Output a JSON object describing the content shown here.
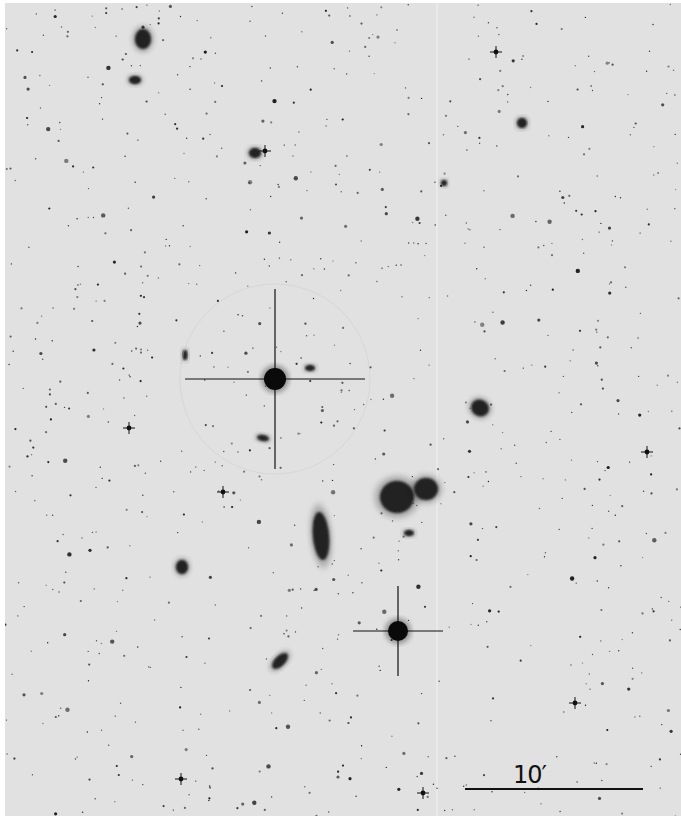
{
  "image": {
    "type": "astronomical photographic plate (negative)",
    "background_color": "#e1e1e1",
    "object_color": "#111111"
  },
  "scale_bar": {
    "label": "10′",
    "length_px": 178
  },
  "objects": {
    "bright_stars": [
      {
        "name": "bright-star-center",
        "x": 270,
        "y": 376,
        "r": 11,
        "spike": 90,
        "halo": 95
      },
      {
        "name": "bright-star-lower",
        "x": 393,
        "y": 628,
        "r": 10,
        "spike": 45,
        "halo": 0
      }
    ],
    "galaxies": [
      {
        "name": "galaxy-pair-a",
        "x": 392,
        "y": 494,
        "rx": 17,
        "ry": 16,
        "rot": 0
      },
      {
        "name": "galaxy-pair-b",
        "x": 421,
        "y": 486,
        "rx": 12,
        "ry": 11,
        "rot": 0
      },
      {
        "name": "spiral-galaxy",
        "x": 316,
        "y": 533,
        "rx": 8,
        "ry": 24,
        "rot": -5
      },
      {
        "name": "elliptical-galaxy-right",
        "x": 475,
        "y": 405,
        "rx": 9,
        "ry": 8,
        "rot": 30
      },
      {
        "name": "galaxy-top-left",
        "x": 138,
        "y": 36,
        "rx": 8,
        "ry": 10,
        "rot": 0
      },
      {
        "name": "galaxy-top-left-2",
        "x": 130,
        "y": 77,
        "rx": 6,
        "ry": 4,
        "rot": 0
      },
      {
        "name": "galaxy-lower-left",
        "x": 275,
        "y": 658,
        "rx": 5,
        "ry": 10,
        "rot": 45
      },
      {
        "name": "galaxy-left",
        "x": 177,
        "y": 564,
        "rx": 6,
        "ry": 7,
        "rot": 0
      },
      {
        "name": "galaxy-upper",
        "x": 250,
        "y": 150,
        "rx": 6,
        "ry": 5,
        "rot": 0
      },
      {
        "name": "galaxy-upper-right",
        "x": 517,
        "y": 120,
        "rx": 5,
        "ry": 5,
        "rot": 0
      },
      {
        "name": "galaxy-small-1",
        "x": 258,
        "y": 435,
        "rx": 6,
        "ry": 3,
        "rot": 10
      },
      {
        "name": "galaxy-small-2",
        "x": 305,
        "y": 365,
        "rx": 5,
        "ry": 3,
        "rot": 0
      },
      {
        "name": "galaxy-small-3",
        "x": 180,
        "y": 352,
        "rx": 2.5,
        "ry": 5,
        "rot": 0
      },
      {
        "name": "galaxy-small-4",
        "x": 439,
        "y": 180,
        "rx": 3,
        "ry": 3,
        "rot": 0
      },
      {
        "name": "galaxy-small-5",
        "x": 404,
        "y": 530,
        "rx": 5,
        "ry": 3,
        "rot": 0
      }
    ],
    "cross_stars": [
      {
        "x": 491,
        "y": 49
      },
      {
        "x": 260,
        "y": 148
      },
      {
        "x": 218,
        "y": 489
      },
      {
        "x": 176,
        "y": 776
      },
      {
        "x": 642,
        "y": 449
      },
      {
        "x": 124,
        "y": 425
      },
      {
        "x": 418,
        "y": 790
      },
      {
        "x": 570,
        "y": 700
      }
    ],
    "star_field_seed": 1973,
    "star_field_count": 900
  }
}
